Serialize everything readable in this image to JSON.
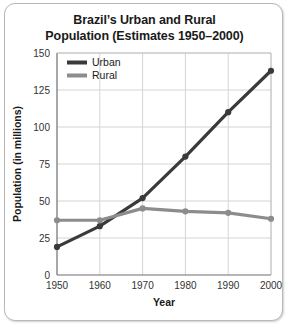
{
  "chart_data": {
    "type": "line",
    "title_line1": "Brazil’s Urban and Rural",
    "title_line2": "Population (Estimates 1950–2000)",
    "xlabel": "Year",
    "ylabel": "Population (in millions)",
    "x": [
      1950,
      1960,
      1970,
      1980,
      1990,
      2000
    ],
    "xtick_labels": [
      "1950",
      "1960",
      "1970",
      "1980",
      "1990",
      "2000"
    ],
    "ytick_labels": [
      "0",
      "25",
      "50",
      "75",
      "100",
      "125",
      "150"
    ],
    "yticks": [
      0,
      25,
      50,
      75,
      100,
      125,
      150
    ],
    "ylim": [
      0,
      150
    ],
    "xlim": [
      1950,
      2000
    ],
    "grid": true,
    "legend_position": "top-left",
    "series": [
      {
        "name": "Urban",
        "color": "#3a3a3a",
        "values": [
          19,
          33,
          52,
          80,
          110,
          138
        ]
      },
      {
        "name": "Rural",
        "color": "#8c8c8c",
        "values": [
          37,
          37,
          45,
          43,
          42,
          38
        ]
      }
    ]
  },
  "legend": {
    "items": [
      {
        "label": "Urban",
        "color": "#3a3a3a"
      },
      {
        "label": "Rural",
        "color": "#8c8c8c"
      }
    ]
  },
  "colors": {
    "urban": "#3a3a3a",
    "rural": "#8c8c8c",
    "grid": "#d4d4d4",
    "axis": "#6e6e6e",
    "frame": "#b8b8b8",
    "text": "#1a1a1a"
  }
}
